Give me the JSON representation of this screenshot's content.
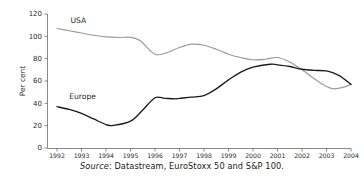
{
  "chart_data": {
    "type": "line",
    "title": "",
    "subtitle": "",
    "xlabel": "",
    "ylabel": "Per cent",
    "xlim": [
      1992,
      2004
    ],
    "ylim": [
      0,
      120
    ],
    "ytick_step": 20,
    "grid": false,
    "legend_position": "inline-labels",
    "x_ticks": [
      "1992",
      "1993",
      "1994",
      "1995",
      "1996",
      "1997",
      "1998",
      "1999",
      "2000",
      "2001",
      "2002",
      "2003",
      "2004"
    ],
    "y_ticks": [
      "0",
      "20",
      "40",
      "60",
      "80",
      "100",
      "120"
    ],
    "series": [
      {
        "name": "USA",
        "color": "#9a9a9a",
        "label_x": 1992.55,
        "label_y": 112,
        "x": [
          1992,
          1992.5,
          1993,
          1993.5,
          1994,
          1994.5,
          1995,
          1995.4,
          1996,
          1996.5,
          1997,
          1997.5,
          1998,
          1998.5,
          1999,
          1999.5,
          2000,
          2000.5,
          2001,
          2001.5,
          2002,
          2002.5,
          2003,
          2003.3,
          2003.7,
          2004
        ],
        "values": [
          107,
          105,
          103,
          101,
          99.5,
          99,
          99.2,
          96,
          84,
          85.5,
          90,
          93,
          92,
          88.5,
          84,
          81,
          79,
          79.5,
          81,
          77,
          70,
          62,
          55,
          53,
          54.5,
          57
        ]
      },
      {
        "name": "Europe",
        "color": "#1b1b1b",
        "label_x": 1992.5,
        "label_y": 44,
        "x": [
          1992,
          1992.5,
          1993,
          1993.5,
          1994,
          1994.3,
          1995,
          1995.5,
          1996,
          1996.4,
          1996.8,
          1997,
          1997.5,
          1998,
          1998.5,
          1999,
          1999.5,
          2000,
          2000.7,
          2001,
          2001.5,
          2002,
          2002.5,
          2003,
          2003.5,
          2004
        ],
        "values": [
          37,
          34.5,
          31,
          26,
          21,
          20.2,
          24,
          34,
          45,
          44.5,
          44,
          44.5,
          45.5,
          47,
          53,
          61,
          68,
          72.5,
          75,
          74.5,
          73,
          70.5,
          69.5,
          69,
          65,
          57
        ]
      }
    ],
    "annotations": []
  },
  "caption": {
    "source_word": "Source",
    "source_text": ": Datastream, EuroStoxx 50 and S&P 100."
  },
  "colors": {
    "usa_line": "#9a9a9a",
    "europe_line": "#1b1b1b",
    "axis": "#6b6b6b",
    "text": "#1a1a1a",
    "background": "#ffffff"
  }
}
